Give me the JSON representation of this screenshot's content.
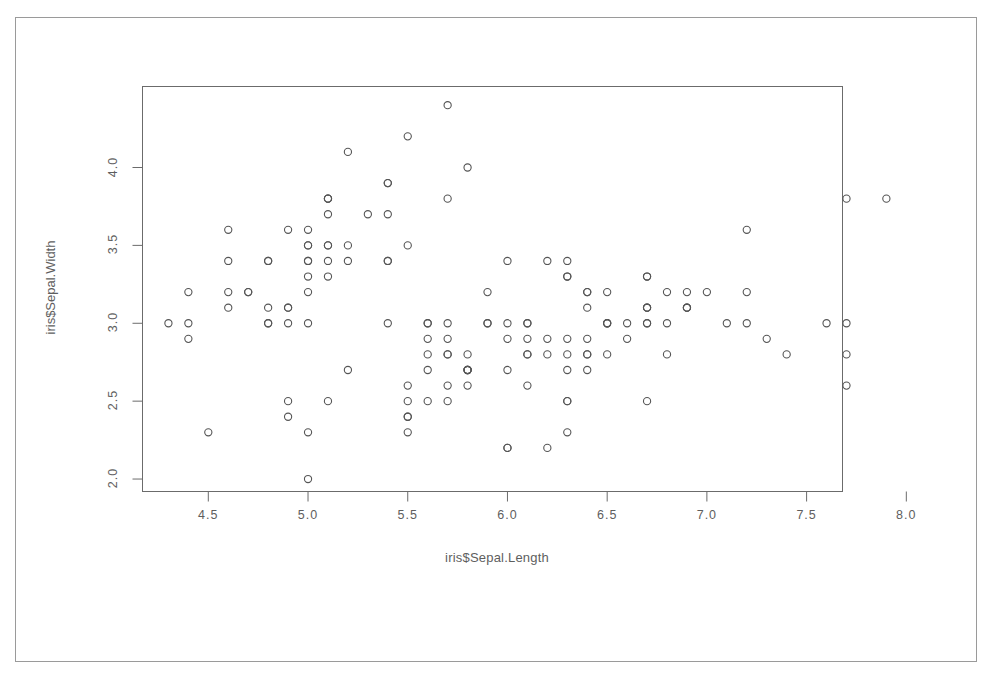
{
  "figure": {
    "kind": "scatterplot",
    "frame_color": "#9a9a9a",
    "background": "#ffffff",
    "axis_color": "#6b6b6b",
    "point_color": "#555555",
    "point_symbol": "open-circle"
  },
  "chart_data": {
    "type": "scatter",
    "title": "",
    "xlabel": "iris$Sepal.Length",
    "ylabel": "iris$Sepal.Width",
    "xlim": [
      4.17,
      7.68
    ],
    "ylim": [
      1.92,
      4.52
    ],
    "xticks": [
      4.5,
      5.0,
      5.5,
      6.0,
      6.5,
      7.0,
      7.5,
      8.0
    ],
    "xtick_labels": [
      "4.5",
      "5.0",
      "5.5",
      "6.0",
      "6.5",
      "7.0",
      "7.5",
      "8.0"
    ],
    "yticks": [
      2.0,
      2.5,
      3.0,
      3.5,
      4.0
    ],
    "ytick_labels": [
      "2.0",
      "2.5",
      "3.0",
      "3.5",
      "4.0"
    ],
    "grid": false,
    "legend": null,
    "n_points": 150,
    "series": [
      {
        "name": "iris",
        "x": [
          5.1,
          4.9,
          4.7,
          4.6,
          5.0,
          5.4,
          4.6,
          5.0,
          4.4,
          4.9,
          5.4,
          4.8,
          4.8,
          4.3,
          5.8,
          5.7,
          5.4,
          5.1,
          5.7,
          5.1,
          5.4,
          5.1,
          4.6,
          5.1,
          4.8,
          5.0,
          5.0,
          5.2,
          5.2,
          4.7,
          4.8,
          5.4,
          5.2,
          5.5,
          4.9,
          5.0,
          5.5,
          4.9,
          4.4,
          5.1,
          5.0,
          4.5,
          4.4,
          5.0,
          5.1,
          4.8,
          5.1,
          4.6,
          5.3,
          5.0,
          7.0,
          6.4,
          6.9,
          5.5,
          6.5,
          5.7,
          6.3,
          4.9,
          6.6,
          5.2,
          5.0,
          5.9,
          6.0,
          6.1,
          5.6,
          6.7,
          5.6,
          5.8,
          6.2,
          5.6,
          5.9,
          6.1,
          6.3,
          6.1,
          6.4,
          6.6,
          6.8,
          6.7,
          6.0,
          5.7,
          5.5,
          5.5,
          5.8,
          6.0,
          5.4,
          6.0,
          6.7,
          6.3,
          5.6,
          5.5,
          5.5,
          6.1,
          5.8,
          5.0,
          5.6,
          5.7,
          5.7,
          6.2,
          5.1,
          5.7,
          6.3,
          5.8,
          7.1,
          6.3,
          6.5,
          7.6,
          4.9,
          7.3,
          6.7,
          7.2,
          6.5,
          6.4,
          6.8,
          5.7,
          5.8,
          6.4,
          6.5,
          7.7,
          7.7,
          6.0,
          6.9,
          5.6,
          7.7,
          6.3,
          6.7,
          7.2,
          6.2,
          6.1,
          6.4,
          7.2,
          7.4,
          7.9,
          6.4,
          6.3,
          6.1,
          7.7,
          6.3,
          6.4,
          6.0,
          6.9,
          6.7,
          6.9,
          5.8,
          6.8,
          6.7,
          6.7,
          6.3,
          6.5,
          6.2,
          5.9
        ],
        "y": [
          3.5,
          3.0,
          3.2,
          3.1,
          3.6,
          3.9,
          3.4,
          3.4,
          2.9,
          3.1,
          3.7,
          3.4,
          3.0,
          3.0,
          4.0,
          4.4,
          3.9,
          3.5,
          3.8,
          3.8,
          3.4,
          3.7,
          3.6,
          3.3,
          3.4,
          3.0,
          3.4,
          3.5,
          3.4,
          3.2,
          3.1,
          3.4,
          4.1,
          4.2,
          3.1,
          3.2,
          3.5,
          3.6,
          3.0,
          3.4,
          3.5,
          2.3,
          3.2,
          3.5,
          3.8,
          3.0,
          3.8,
          3.2,
          3.7,
          3.3,
          3.2,
          3.2,
          3.1,
          2.3,
          2.8,
          2.8,
          3.3,
          2.4,
          2.9,
          2.7,
          2.0,
          3.0,
          2.2,
          2.9,
          2.9,
          3.1,
          3.0,
          2.7,
          2.2,
          2.5,
          3.2,
          2.8,
          2.5,
          2.8,
          2.9,
          3.0,
          2.8,
          3.0,
          2.9,
          2.6,
          2.4,
          2.4,
          2.7,
          2.7,
          3.0,
          3.4,
          3.1,
          2.3,
          3.0,
          2.5,
          2.6,
          3.0,
          2.6,
          2.3,
          2.7,
          3.0,
          2.9,
          2.9,
          2.5,
          2.8,
          3.3,
          2.7,
          3.0,
          2.9,
          3.0,
          3.0,
          2.5,
          2.9,
          2.5,
          3.6,
          3.2,
          2.7,
          3.0,
          2.5,
          2.8,
          3.2,
          3.0,
          3.8,
          2.6,
          2.2,
          3.2,
          2.8,
          2.8,
          2.7,
          3.3,
          3.2,
          2.8,
          3.0,
          2.8,
          3.0,
          2.8,
          3.8,
          2.8,
          2.8,
          2.6,
          3.0,
          3.4,
          3.1,
          3.0,
          3.1,
          3.1,
          3.1,
          2.7,
          3.2,
          3.3,
          3.0,
          2.5,
          3.0,
          3.4,
          3.0
        ]
      }
    ]
  }
}
